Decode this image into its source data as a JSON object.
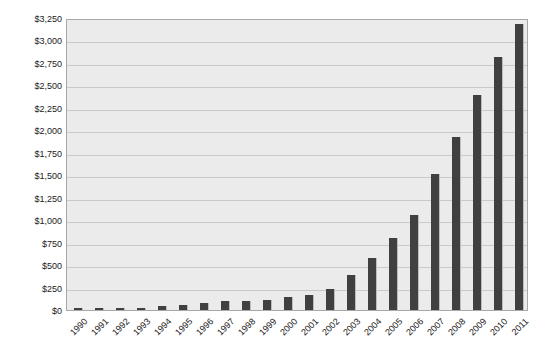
{
  "chart_data": {
    "type": "bar",
    "title": "",
    "xlabel": "",
    "ylabel": "",
    "ylim": [
      0,
      3250
    ],
    "ytick_step": 250,
    "grid": true,
    "legend": "none",
    "bar_color": "#404040",
    "plot_background": "#ebebeb",
    "gridline_color": "#c9c9c9",
    "border_color": "#a8a8a8",
    "categories": [
      "1990",
      "1991",
      "1992",
      "1993",
      "1994",
      "1995",
      "1996",
      "1997",
      "1998",
      "1999",
      "2000",
      "2001",
      "2002",
      "2003",
      "2004",
      "2005",
      "2006",
      "2007",
      "2008",
      "2009",
      "2010",
      "2011"
    ],
    "values": [
      20,
      25,
      15,
      15,
      40,
      55,
      80,
      100,
      105,
      110,
      150,
      165,
      230,
      390,
      580,
      800,
      1060,
      1510,
      1930,
      2390,
      2820,
      3180
    ],
    "ytick_labels": [
      "$3,250",
      "$3,000",
      "$2,750",
      "$2,500",
      "$2,250",
      "$2,000",
      "$1,750",
      "$1,500",
      "$1,250",
      "$1,000",
      "$750",
      "$500",
      "$250",
      "$0"
    ],
    "ytick_values": [
      3250,
      3000,
      2750,
      2500,
      2250,
      2000,
      1750,
      1500,
      1250,
      1000,
      750,
      500,
      250,
      0
    ]
  },
  "caption": {
    "text": ""
  }
}
